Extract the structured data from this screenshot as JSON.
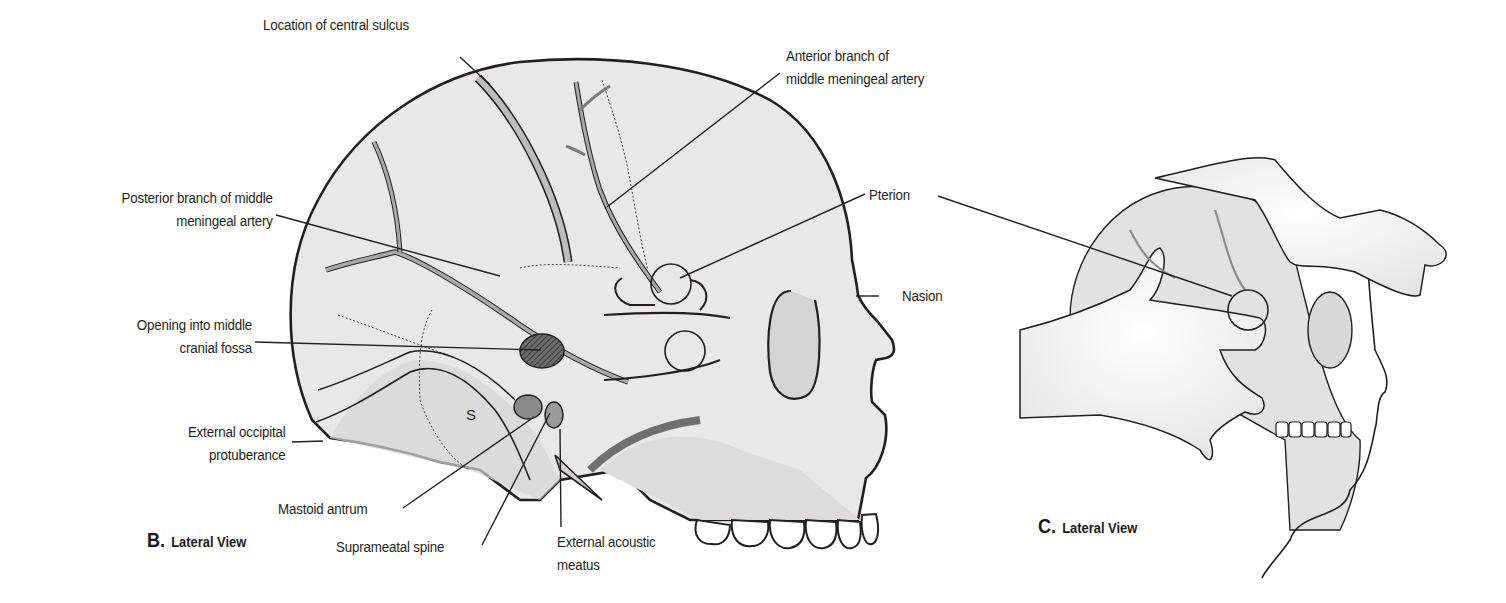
{
  "panel_b": {
    "caption_letter": "B.",
    "caption_text": "Lateral View",
    "labels": {
      "central_sulcus": "Location of central sulcus",
      "anterior_branch_1": "Anterior branch of",
      "anterior_branch_2": "middle meningeal artery",
      "posterior_branch_1": "Posterior branch of middle",
      "posterior_branch_2": "meningeal artery",
      "pterion": "Pterion",
      "nasion": "Nasion",
      "opening_1": "Opening into middle",
      "opening_2": "cranial fossa",
      "occipital_1": "External occipital",
      "occipital_2": "protuberance",
      "mastoid_antrum": "Mastoid antrum",
      "suprameatal_spine": "Suprameatal spine",
      "acoustic_1": "External acoustic",
      "acoustic_2": "meatus",
      "sigmoid_marker": "S"
    }
  },
  "panel_c": {
    "caption_letter": "C.",
    "caption_text": "Lateral View"
  },
  "colors": {
    "ink": "#231f20",
    "bone": "#e6e6e6",
    "bone_shade": "#d2d2d2",
    "vessel": "#9a9a9a",
    "skin": "#f2f2f2"
  }
}
